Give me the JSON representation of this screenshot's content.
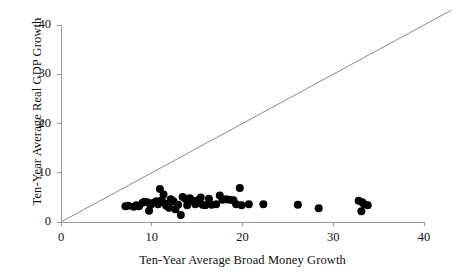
{
  "chart_data": {
    "type": "scatter",
    "title": "",
    "xlabel": "Ten-Year Average Broad Money Growth",
    "ylabel": "Ten-Year Average Real GDP Growth",
    "xlim": [
      0,
      40
    ],
    "ylim": [
      0,
      40
    ],
    "xticks": [
      0,
      10,
      20,
      30,
      40
    ],
    "yticks": [
      0,
      10,
      20,
      30,
      40
    ],
    "xtick_labels": [
      "0",
      "10",
      "20",
      "30",
      "40"
    ],
    "ytick_labels": [
      "0",
      "10",
      "20",
      "30",
      "40"
    ],
    "grid": false,
    "legend": null,
    "annotations": [
      {
        "name": "forty-five-degree-line",
        "type": "line",
        "description": "45-degree reference line y = x",
        "from": [
          0,
          0
        ],
        "to": [
          43,
          43
        ],
        "color": "#8b8b8b"
      }
    ],
    "series": [
      {
        "name": "Countries",
        "marker": "filled-circle",
        "color": "#000000",
        "marker_size": 8,
        "points": [
          [
            7.1,
            3.2
          ],
          [
            7.4,
            3.3
          ],
          [
            8.0,
            3.1
          ],
          [
            8.3,
            3.4
          ],
          [
            8.6,
            3.2
          ],
          [
            9.0,
            3.9
          ],
          [
            9.2,
            4.1
          ],
          [
            9.5,
            4.0
          ],
          [
            9.7,
            2.3
          ],
          [
            9.9,
            3.5
          ],
          [
            10.2,
            3.9
          ],
          [
            10.5,
            4.2
          ],
          [
            10.7,
            3.6
          ],
          [
            10.9,
            6.7
          ],
          [
            11.1,
            4.4
          ],
          [
            11.3,
            5.6
          ],
          [
            11.5,
            3.7
          ],
          [
            11.6,
            3.3
          ],
          [
            11.9,
            2.9
          ],
          [
            12.1,
            4.6
          ],
          [
            12.4,
            4.2
          ],
          [
            12.6,
            2.6
          ],
          [
            12.9,
            3.5
          ],
          [
            13.2,
            1.4
          ],
          [
            13.4,
            5.1
          ],
          [
            13.7,
            4.7
          ],
          [
            13.9,
            3.4
          ],
          [
            14.2,
            4.8
          ],
          [
            14.5,
            4.3
          ],
          [
            14.8,
            3.6
          ],
          [
            15.1,
            4.4
          ],
          [
            15.4,
            5.0
          ],
          [
            15.6,
            3.5
          ],
          [
            15.9,
            3.4
          ],
          [
            16.3,
            4.7
          ],
          [
            16.6,
            3.5
          ],
          [
            17.1,
            3.6
          ],
          [
            17.5,
            5.4
          ],
          [
            17.8,
            4.5
          ],
          [
            18.2,
            4.6
          ],
          [
            18.6,
            4.5
          ],
          [
            19.0,
            4.4
          ],
          [
            19.3,
            3.6
          ],
          [
            19.7,
            6.9
          ],
          [
            19.9,
            3.4
          ],
          [
            20.7,
            3.6
          ],
          [
            22.3,
            3.6
          ],
          [
            26.1,
            3.5
          ],
          [
            28.4,
            2.8
          ],
          [
            32.8,
            4.3
          ],
          [
            33.2,
            4.0
          ],
          [
            33.4,
            3.6
          ],
          [
            33.1,
            2.2
          ],
          [
            33.8,
            3.4
          ]
        ]
      }
    ]
  },
  "axes": {
    "ylabel_text": "Ten-Year Average Real GDP Growth",
    "xlabel_text": "Ten-Year Average Broad Money Growth"
  }
}
